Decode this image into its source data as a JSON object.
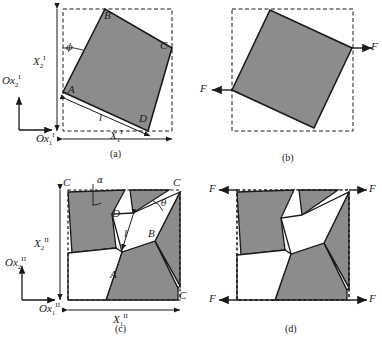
{
  "figure": {
    "type": "technical-diagram",
    "colors": {
      "shaded_fill": "#8c8c8c",
      "white_fill": "#ffffff",
      "stroke": "#1a1a1a",
      "dashed_stroke": "#1a1a1a",
      "background": "#ffffff"
    },
    "panels": [
      {
        "id": "a",
        "caption": "(a)",
        "axis_x_label": "Ox",
        "axis_x_sub": "1",
        "axis_x_sup": "I",
        "axis_y_label": "Ox",
        "axis_y_sub": "2",
        "axis_y_sup": "I",
        "dim_h_label": "X",
        "dim_h_sub": "1",
        "dim_h_sup": "I",
        "dim_v_label": "X",
        "dim_v_sub": "2",
        "dim_v_sup": "I",
        "angle_label": "ϕ",
        "length_label": "l",
        "vertices": [
          "A",
          "B",
          "C",
          "D"
        ]
      },
      {
        "id": "b",
        "caption": "(b)",
        "force_labels": [
          "F",
          "F"
        ]
      },
      {
        "id": "c",
        "caption": "(c)",
        "axis_x_label": "Ox",
        "axis_x_sub": "1",
        "axis_x_sup": "II",
        "axis_y_label": "Ox",
        "axis_y_sub": "2",
        "axis_y_sup": "II",
        "dim_h_label": "X",
        "dim_h_sub": "1",
        "dim_h_sup": "II",
        "dim_v_label": "X",
        "dim_v_sub": "2",
        "dim_v_sup": "II",
        "angle_alpha": "α",
        "angle_theta": "θ",
        "length_label": "l",
        "vertices": [
          "A",
          "B",
          "C",
          "D"
        ],
        "corner_labels": [
          "C",
          "C",
          "C"
        ]
      },
      {
        "id": "d",
        "caption": "(d)",
        "force_labels": [
          "F",
          "F",
          "F",
          "F"
        ]
      }
    ]
  },
  "geometry": {
    "panel_a": {
      "box": [
        63,
        9,
        172,
        131
      ],
      "square": "63,92 105,9 172,48 148,131"
    },
    "panel_b": {
      "box": [
        232,
        9,
        353,
        131
      ],
      "square": "232,90 270,10 352,48 314,128"
    },
    "panel_c": {
      "box": [
        68,
        190,
        180,
        300
      ]
    },
    "panel_d": {
      "box": [
        237,
        190,
        349,
        300
      ]
    }
  }
}
